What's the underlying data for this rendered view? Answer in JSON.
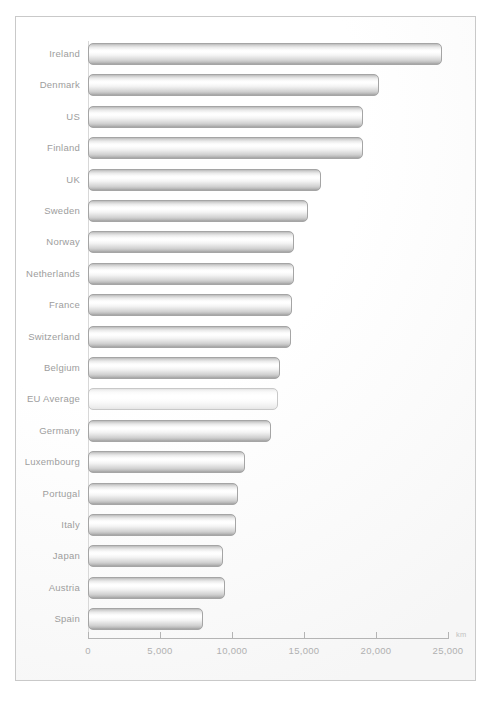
{
  "chart_data": {
    "type": "bar",
    "orientation": "horizontal",
    "title": "",
    "subtitle": "",
    "xlabel": "km",
    "ylabel": "",
    "unit": "km",
    "xlim": [
      0,
      25000
    ],
    "grid": false,
    "legend": false,
    "tick_labels": [
      "0",
      "5,000",
      "10,000",
      "15,000",
      "20,000",
      "25,000"
    ],
    "ticks": [
      0,
      5000,
      10000,
      15000,
      20000,
      25000
    ],
    "categories": [
      "Ireland",
      "Denmark",
      "US",
      "Finland",
      "UK",
      "Sweden",
      "Norway",
      "Netherlands",
      "France",
      "Switzerland",
      "Belgium",
      "EU Average",
      "Germany",
      "Luxembourg",
      "Portugal",
      "Italy",
      "Japan",
      "Austria",
      "Spain"
    ],
    "values": [
      24600,
      20200,
      19100,
      19100,
      16200,
      15300,
      14300,
      14300,
      14200,
      14100,
      13300,
      13200,
      12700,
      10900,
      10400,
      10300,
      9400,
      9500,
      8000
    ],
    "highlight_category": "EU Average",
    "colors": {
      "bar_fill_light": "#ffffff",
      "bar_fill_mid": "#e2e2e2",
      "bar_fill_dark": "#9e9e9e",
      "bar_border": "#a5a5a5",
      "highlight_fill": "#fafafa",
      "highlight_border": "#c8c8c8",
      "label_text": "#9d9d9d",
      "tick_text": "#b0b0b0",
      "axis_line": "#b4b4b4",
      "frame_border": "#c9c9c9",
      "background": "#ffffff"
    }
  }
}
